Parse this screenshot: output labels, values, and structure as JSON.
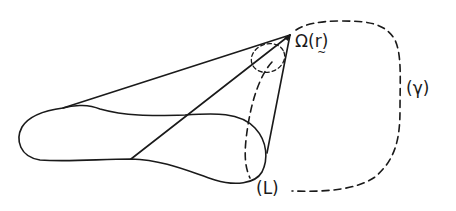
{
  "figure": {
    "type": "geometric diagram",
    "labels": {
      "omega": "Ω(r)",
      "omega_symbol": "Ω",
      "omega_open": "(",
      "omega_arg": "r",
      "omega_close": ")",
      "gamma": "(γ)",
      "L": "(L)"
    },
    "elements": {
      "apex_point": "Ω(r)",
      "closed_contour": "elongated closed loop (body)",
      "dashed_curve": "γ",
      "dashed_boundary": "L",
      "cone_lines": 3,
      "small_dashed_ellipse": "solid-angle marker near apex"
    },
    "colors": {
      "ink": "#1a1a1a",
      "background": "#ffffff"
    }
  }
}
